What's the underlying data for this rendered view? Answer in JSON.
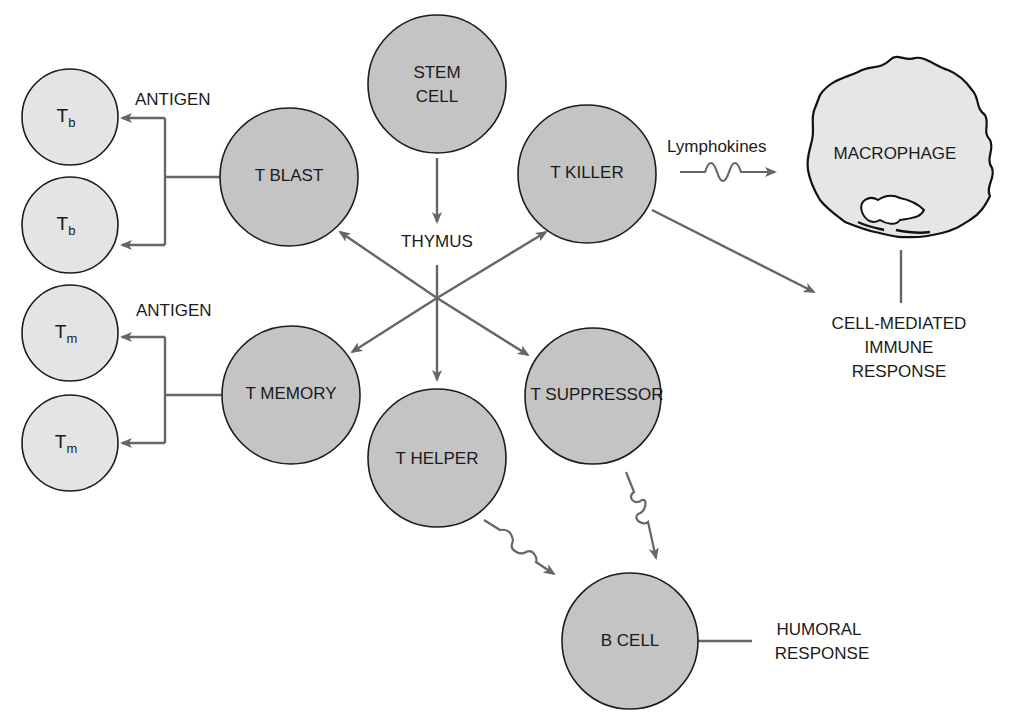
{
  "diagram": {
    "colors": {
      "cell_fill": "#c4c4c4",
      "small_cell_fill": "#e4e4e4",
      "arrow": "#666666",
      "outline": "#1c1c1c"
    },
    "nodes": {
      "stem_cell": {
        "line1": "STEM",
        "line2": "CELL"
      },
      "t_blast": "T BLAST",
      "t_killer": "T KILLER",
      "t_memory": "T MEMORY",
      "t_helper": "T HELPER",
      "t_suppressor": "T SUPPRESSOR",
      "b_cell": "B CELL",
      "macrophage": "MACROPHAGE",
      "tb_1": {
        "main": "T",
        "sub": "b"
      },
      "tb_2": {
        "main": "T",
        "sub": "b"
      },
      "tm_1": {
        "main": "T",
        "sub": "m"
      },
      "tm_2": {
        "main": "T",
        "sub": "m"
      }
    },
    "labels": {
      "thymus": "THYMUS",
      "antigen_top": "ANTIGEN",
      "antigen_bottom": "ANTIGEN",
      "lymphokines": "Lymphokines",
      "cell_mediated": {
        "line1": "CELL-MEDIATED",
        "line2": "IMMUNE",
        "line3": "RESPONSE"
      },
      "humoral": {
        "line1": "HUMORAL",
        "line2": "RESPONSE"
      }
    },
    "edges": [
      {
        "from": "STEM CELL",
        "to": "THYMUS",
        "style": "arrow"
      },
      {
        "from": "THYMUS",
        "to": "T BLAST",
        "style": "arrow"
      },
      {
        "from": "THYMUS",
        "to": "T KILLER",
        "style": "arrow"
      },
      {
        "from": "THYMUS",
        "to": "T MEMORY",
        "style": "arrow"
      },
      {
        "from": "THYMUS",
        "to": "T HELPER",
        "style": "arrow"
      },
      {
        "from": "THYMUS",
        "to": "T SUPPRESSOR",
        "style": "arrow"
      },
      {
        "from": "T BLAST",
        "to": "Tb",
        "style": "branch-arrow",
        "label": "ANTIGEN"
      },
      {
        "from": "T MEMORY",
        "to": "Tm",
        "style": "branch-arrow",
        "label": "ANTIGEN"
      },
      {
        "from": "T KILLER",
        "to": "MACROPHAGE",
        "style": "wavy-arrow",
        "label": "Lymphokines"
      },
      {
        "from": "T KILLER",
        "to": "CELL-MEDIATED IMMUNE RESPONSE",
        "style": "arrow"
      },
      {
        "from": "MACROPHAGE",
        "to": "CELL-MEDIATED IMMUNE RESPONSE",
        "style": "line"
      },
      {
        "from": "T HELPER",
        "to": "B CELL",
        "style": "wavy-arrow"
      },
      {
        "from": "T SUPPRESSOR",
        "to": "B CELL",
        "style": "wavy-arrow"
      },
      {
        "from": "B CELL",
        "to": "HUMORAL RESPONSE",
        "style": "line"
      }
    ]
  }
}
